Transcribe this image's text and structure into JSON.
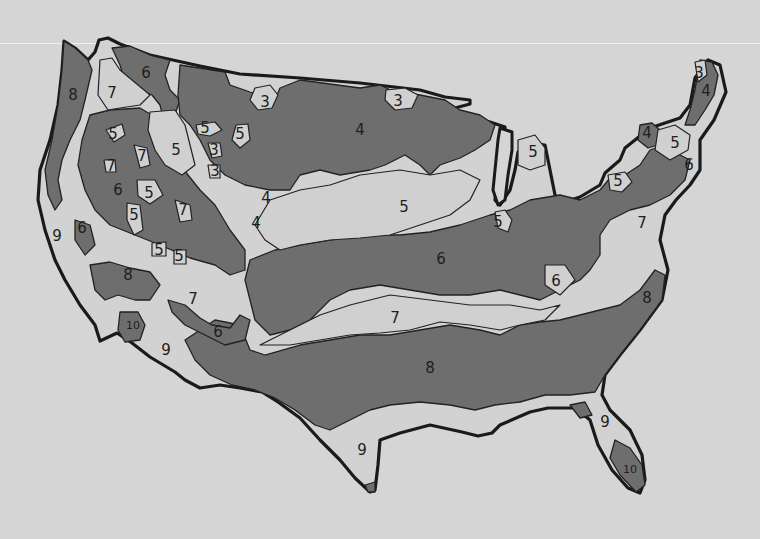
{
  "map": {
    "subject": "United States plant hardiness zones (hand-drawn)",
    "colors": {
      "background": "#d5d5d5",
      "light_zone": "#d0d0d0",
      "dark_zone": "#6e6e6e",
      "outline": "#1a1a1a"
    },
    "zone_labels": [
      {
        "id": "pnw-8",
        "text": "8",
        "x": 73,
        "y": 95
      },
      {
        "id": "wa-7",
        "text": "7",
        "x": 112,
        "y": 93
      },
      {
        "id": "id-6",
        "text": "6",
        "x": 146,
        "y": 73
      },
      {
        "id": "mt-3",
        "text": "3",
        "x": 265,
        "y": 102
      },
      {
        "id": "nd-3",
        "text": "3",
        "x": 398,
        "y": 101
      },
      {
        "id": "mn-4",
        "text": "4",
        "x": 360,
        "y": 130
      },
      {
        "id": "or-5a",
        "text": "5",
        "x": 113,
        "y": 134
      },
      {
        "id": "id-5b",
        "text": "5",
        "x": 176,
        "y": 150
      },
      {
        "id": "wy-5c",
        "text": "5",
        "x": 205,
        "y": 128
      },
      {
        "id": "wy-5d",
        "text": "5",
        "x": 240,
        "y": 134
      },
      {
        "id": "wy-3a",
        "text": "3",
        "x": 214,
        "y": 150
      },
      {
        "id": "wy-3b",
        "text": "3",
        "x": 215,
        "y": 171
      },
      {
        "id": "or-7a",
        "text": "7",
        "x": 142,
        "y": 156
      },
      {
        "id": "or-7b",
        "text": "7",
        "x": 111,
        "y": 166
      },
      {
        "id": "nv-6",
        "text": "6",
        "x": 118,
        "y": 190
      },
      {
        "id": "nv-5a",
        "text": "5",
        "x": 149,
        "y": 193
      },
      {
        "id": "ut-5b",
        "text": "5",
        "x": 134,
        "y": 215
      },
      {
        "id": "ut-7",
        "text": "7",
        "x": 183,
        "y": 210
      },
      {
        "id": "co-4a",
        "text": "4",
        "x": 266,
        "y": 198
      },
      {
        "id": "co-4b",
        "text": "4",
        "x": 256,
        "y": 223
      },
      {
        "id": "ca-9",
        "text": "9",
        "x": 57,
        "y": 236
      },
      {
        "id": "ca-6",
        "text": "6",
        "x": 82,
        "y": 228
      },
      {
        "id": "az-5a",
        "text": "5",
        "x": 159,
        "y": 250
      },
      {
        "id": "az-5b",
        "text": "5",
        "x": 179,
        "y": 256
      },
      {
        "id": "ne-5",
        "text": "5",
        "x": 404,
        "y": 207
      },
      {
        "id": "ks-6",
        "text": "6",
        "x": 441,
        "y": 259
      },
      {
        "id": "wi-5",
        "text": "5",
        "x": 533,
        "y": 152
      },
      {
        "id": "mi-5",
        "text": "5",
        "x": 498,
        "y": 222
      },
      {
        "id": "pa-5",
        "text": "5",
        "x": 618,
        "y": 181
      },
      {
        "id": "ny-4",
        "text": "4",
        "x": 647,
        "y": 133
      },
      {
        "id": "vt-5",
        "text": "5",
        "x": 675,
        "y": 143
      },
      {
        "id": "ma-6",
        "text": "6",
        "x": 689,
        "y": 165
      },
      {
        "id": "me-3",
        "text": "3",
        "x": 699,
        "y": 73
      },
      {
        "id": "me-4",
        "text": "4",
        "x": 706,
        "y": 91
      },
      {
        "id": "va-7",
        "text": "7",
        "x": 642,
        "y": 223
      },
      {
        "id": "ky-6",
        "text": "6",
        "x": 556,
        "y": 281
      },
      {
        "id": "nc-8",
        "text": "8",
        "x": 647,
        "y": 298
      },
      {
        "id": "az-8",
        "text": "8",
        "x": 128,
        "y": 275
      },
      {
        "id": "az-7",
        "text": "7",
        "x": 193,
        "y": 299
      },
      {
        "id": "az-6",
        "text": "6",
        "x": 218,
        "y": 332
      },
      {
        "id": "ok-7",
        "text": "7",
        "x": 395,
        "y": 318
      },
      {
        "id": "ca-10",
        "text": "10",
        "x": 133,
        "y": 326
      },
      {
        "id": "ca-9b",
        "text": "9",
        "x": 166,
        "y": 350
      },
      {
        "id": "tx-8",
        "text": "8",
        "x": 430,
        "y": 368
      },
      {
        "id": "tx-9",
        "text": "9",
        "x": 362,
        "y": 450
      },
      {
        "id": "fl-9",
        "text": "9",
        "x": 605,
        "y": 422
      },
      {
        "id": "fl-10",
        "text": "10",
        "x": 630,
        "y": 470
      }
    ]
  }
}
